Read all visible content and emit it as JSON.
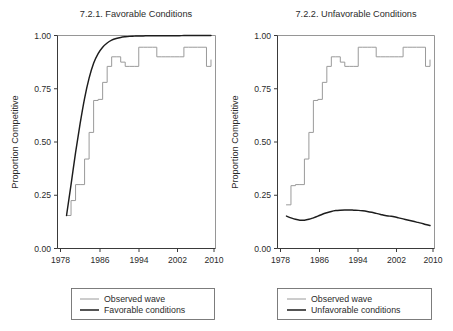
{
  "figure": {
    "width": 453,
    "height": 331,
    "background": "#ffffff"
  },
  "colors": {
    "observed": "#9a9a9a",
    "model": "#1d1d1d",
    "axis": "#3a3a3a",
    "frame": "#8a8a8a",
    "text": "#2b2b2b"
  },
  "chart_data": [
    {
      "type": "line",
      "panel_id": "favorable",
      "title": "7.2.1. Favorable Conditions",
      "xlabel": "",
      "ylabel": "Proportion Competitive",
      "xlim": [
        1976,
        2011
      ],
      "ylim": [
        0.0,
        1.0
      ],
      "xticks": [
        1978,
        1986,
        1994,
        2002,
        2010
      ],
      "xtick_labels": [
        "1978",
        "1986",
        "1994",
        "2002",
        "2010"
      ],
      "yticks": [
        0.0,
        0.25,
        0.5,
        0.75,
        1.0
      ],
      "ytick_labels": [
        "0.00",
        "0.25",
        "0.50",
        "0.75",
        "1.00"
      ],
      "grid": false,
      "legend_position": "below",
      "series": [
        {
          "name": "Observed wave",
          "color": "#9a9a9a",
          "style": "step",
          "x": [
            1978,
            1979,
            1980,
            1981,
            1982,
            1983,
            1984,
            1985,
            1986,
            1987,
            1988,
            1989,
            1990,
            1991,
            1992,
            1993,
            1994,
            1995,
            1996,
            1997,
            1998,
            1999,
            2000,
            2001,
            2002,
            2003,
            2004,
            2005,
            2006,
            2007,
            2008,
            2009,
            2010
          ],
          "values": [
            0.155,
            0.225,
            0.3,
            0.3,
            0.42,
            0.545,
            0.695,
            0.7,
            0.78,
            0.855,
            0.9,
            0.9,
            0.875,
            0.855,
            0.855,
            0.855,
            0.945,
            0.945,
            0.945,
            0.945,
            0.9,
            0.9,
            0.9,
            0.9,
            0.9,
            0.9,
            0.945,
            0.945,
            0.945,
            0.945,
            0.945,
            0.855,
            0.885
          ]
        },
        {
          "name": "Favorable conditions",
          "color": "#1d1d1d",
          "style": "smooth",
          "x": [
            1978,
            1979,
            1980,
            1981,
            1982,
            1983,
            1984,
            1985,
            1986,
            1987,
            1988,
            1989,
            1990,
            1991,
            1992,
            1993,
            1994,
            1995,
            1996,
            1997,
            1998,
            1999,
            2000,
            2001,
            2002,
            2003,
            2004,
            2005,
            2006,
            2007,
            2008,
            2009,
            2010
          ],
          "values": [
            0.155,
            0.3,
            0.45,
            0.585,
            0.705,
            0.8,
            0.87,
            0.915,
            0.945,
            0.965,
            0.978,
            0.986,
            0.991,
            0.994,
            0.996,
            0.997,
            0.998,
            0.998,
            0.999,
            0.999,
            0.999,
            0.999,
            0.999,
            0.999,
            0.999,
            0.999,
            1.0,
            1.0,
            1.0,
            1.0,
            1.0,
            1.0,
            1.0
          ]
        }
      ],
      "legend": [
        {
          "label": "Observed wave",
          "color": "#9a9a9a"
        },
        {
          "label": "Favorable conditions",
          "color": "#1d1d1d"
        }
      ]
    },
    {
      "type": "line",
      "panel_id": "unfavorable",
      "title": "7.2.2. Unfavorable Conditions",
      "xlabel": "",
      "ylabel": "Proportion Competitive",
      "xlim": [
        1976,
        2011
      ],
      "ylim": [
        0.0,
        1.0
      ],
      "xticks": [
        1978,
        1986,
        1994,
        2002,
        2010
      ],
      "xtick_labels": [
        "1978",
        "1986",
        "1994",
        "2002",
        "2010"
      ],
      "yticks": [
        0.0,
        0.25,
        0.5,
        0.75,
        1.0
      ],
      "ytick_labels": [
        "0.00",
        "0.25",
        "0.50",
        "0.75",
        "1.00"
      ],
      "grid": false,
      "legend_position": "below",
      "series": [
        {
          "name": "Observed wave",
          "color": "#9a9a9a",
          "style": "step",
          "x": [
            1978,
            1979,
            1980,
            1981,
            1982,
            1983,
            1984,
            1985,
            1986,
            1987,
            1988,
            1989,
            1990,
            1991,
            1992,
            1993,
            1994,
            1995,
            1996,
            1997,
            1998,
            1999,
            2000,
            2001,
            2002,
            2003,
            2004,
            2005,
            2006,
            2007,
            2008,
            2009,
            2010
          ],
          "values": [
            0.205,
            0.295,
            0.3,
            0.3,
            0.42,
            0.545,
            0.695,
            0.7,
            0.78,
            0.855,
            0.9,
            0.9,
            0.875,
            0.855,
            0.855,
            0.855,
            0.945,
            0.945,
            0.945,
            0.945,
            0.9,
            0.9,
            0.9,
            0.9,
            0.9,
            0.9,
            0.945,
            0.945,
            0.945,
            0.945,
            0.945,
            0.855,
            0.885
          ]
        },
        {
          "name": "Unfavorable conditions",
          "color": "#1d1d1d",
          "style": "smooth",
          "x": [
            1978,
            1979,
            1980,
            1981,
            1982,
            1983,
            1984,
            1985,
            1986,
            1987,
            1988,
            1989,
            1990,
            1991,
            1992,
            1993,
            1994,
            1995,
            1996,
            1997,
            1998,
            1999,
            2000,
            2001,
            2002,
            2003,
            2004,
            2005,
            2006,
            2007,
            2008,
            2009,
            2010
          ],
          "values": [
            0.152,
            0.144,
            0.137,
            0.133,
            0.133,
            0.137,
            0.144,
            0.152,
            0.161,
            0.168,
            0.174,
            0.178,
            0.18,
            0.181,
            0.181,
            0.18,
            0.179,
            0.177,
            0.174,
            0.17,
            0.165,
            0.16,
            0.155,
            0.152,
            0.149,
            0.144,
            0.139,
            0.134,
            0.129,
            0.124,
            0.119,
            0.113,
            0.108
          ]
        }
      ],
      "legend": [
        {
          "label": "Observed wave",
          "color": "#9a9a9a"
        },
        {
          "label": "Unfavorable conditions",
          "color": "#1d1d1d"
        }
      ]
    }
  ]
}
